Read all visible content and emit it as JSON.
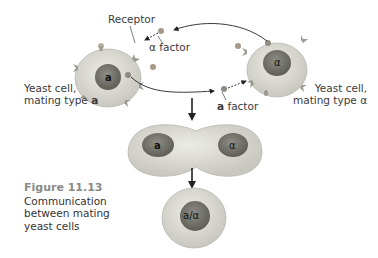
{
  "labels": {
    "receptor": "Receptor",
    "alpha_factor": "α factor",
    "a_factor_bold": "a",
    "a_factor_rest": " factor",
    "cell_a_line1": "Yeast cell,",
    "cell_a_line2": "mating type ",
    "cell_a_type": "a",
    "cell_alpha_line1": "Yeast cell,",
    "cell_alpha_line2": "mating type ",
    "cell_alpha_type": "α"
  },
  "nuclei": {
    "cell_a": "a",
    "cell_alpha": "α",
    "fused_left": "a",
    "fused_right": "α",
    "diploid": "a/α"
  },
  "caption": {
    "number": "Figure 11.13",
    "line1": "Communication",
    "line2": "between mating",
    "line3": "yeast cells"
  },
  "colors": {
    "cytoplasm": "#dcdcd4",
    "nucleus": "#7a7a70",
    "receptor": "#9a9a92",
    "arrow": "#222222"
  }
}
